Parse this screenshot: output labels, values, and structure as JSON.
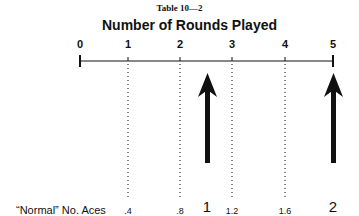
{
  "header": {
    "table_label": "Table 10—2",
    "title": "Number of Rounds Played"
  },
  "axis": {
    "ticks": [
      {
        "label": "0",
        "x": 80
      },
      {
        "label": "1",
        "x": 128
      },
      {
        "label": "2",
        "x": 180
      },
      {
        "label": "3",
        "x": 232
      },
      {
        "label": "4",
        "x": 285
      },
      {
        "label": "5",
        "x": 333
      }
    ]
  },
  "aces_row": {
    "label": "“Normal” No. Aces",
    "small_values": [
      {
        "label": ".4",
        "x": 128
      },
      {
        "label": ".8",
        "x": 180
      },
      {
        "label": "1.2",
        "x": 232
      },
      {
        "label": "1.6",
        "x": 285
      }
    ],
    "big_values": [
      {
        "label": "1",
        "x": 207
      },
      {
        "label": "2",
        "x": 333
      }
    ]
  },
  "arrows": [
    {
      "name": "arrow-ace-1",
      "x": 207
    },
    {
      "name": "arrow-ace-2",
      "x": 333
    }
  ],
  "colors": {
    "ink": "#111111",
    "background": "#ffffff"
  }
}
